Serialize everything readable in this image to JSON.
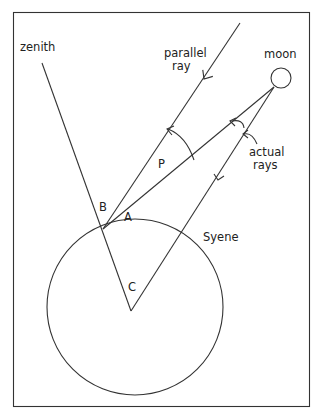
{
  "diagram": {
    "labels": {
      "zenith": "zenith",
      "parallel_ray_1": "parallel",
      "parallel_ray_2": "ray",
      "moon": "moon",
      "actual_rays_1": "actual",
      "actual_rays_2": "rays",
      "point_b": "B",
      "point_a": "A",
      "point_p": "P",
      "point_c": "C",
      "syene": "Syene"
    },
    "colors": {
      "stroke": "#333333",
      "background": "#ffffff"
    }
  }
}
